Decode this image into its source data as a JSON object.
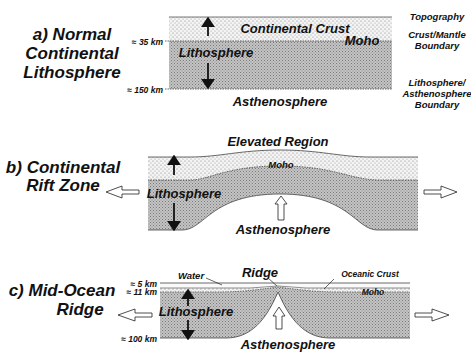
{
  "panels": [
    {
      "id": "a",
      "title_line1": "a) Normal",
      "title_line2": "Continental",
      "title_line3": "Lithosphere",
      "depth_labels": [
        "≈ 35 km",
        "≈ 150 km"
      ],
      "layer_labels": {
        "crust": "Continental Crust",
        "lithosphere": "Lithosphere",
        "asthenosphere": "Asthenosphere",
        "moho": "Moho"
      },
      "right_labels": [
        "Topography",
        "Crust/Mantle",
        "Boundary",
        "Lithosphere/",
        "Asthenosphere",
        "Boundary"
      ]
    },
    {
      "id": "b",
      "title_line1": "b) Continental",
      "title_line2": "Rift Zone",
      "layer_labels": {
        "top": "Elevated Region",
        "moho": "Moho",
        "lithosphere": "Lithosphere",
        "asthenosphere": "Asthenosphere"
      }
    },
    {
      "id": "c",
      "title_line1": "c) Mid-Ocean",
      "title_line2": "Ridge",
      "depth_labels": [
        "≈ 5 km",
        "≈ 11 km",
        "≈ 100 km"
      ],
      "layer_labels": {
        "water": "Water",
        "ridge": "Ridge",
        "oceanic_crust": "Oceanic Crust",
        "moho": "Moho",
        "lithosphere": "Lithosphere",
        "asthenosphere": "Asthenosphere"
      }
    }
  ],
  "colors": {
    "crust_fill": "#efefef",
    "mantle_fill": "#b9b9b9",
    "line": "#222222",
    "text": "#111111"
  }
}
